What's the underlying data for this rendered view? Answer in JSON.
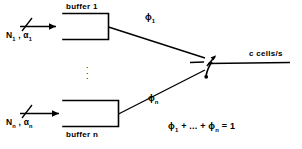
{
  "figure": {
    "type": "queueing-scheduler-diagram"
  },
  "buffers": [
    {
      "id": "buffer-1",
      "title": "buffer  1",
      "input_label_main": "N",
      "input_label_sub1": "1",
      "input_label_sep": " ,  ",
      "input_label_alpha": "α",
      "input_label_sub2": "1",
      "weight_symbol": "ϕ",
      "weight_sub": "1"
    },
    {
      "id": "buffer-n",
      "title": "buffer  n",
      "input_label_main": "N",
      "input_label_sub1": "n",
      "input_label_sep": " ,  ",
      "input_label_alpha": "α",
      "input_label_sub2": "n",
      "weight_symbol": "ϕ",
      "weight_sub": "n"
    }
  ],
  "vertical_ellipsis": "⋮",
  "output": {
    "rate_label": "c  cells/s",
    "switch_name": "selector-switch"
  },
  "constraint": {
    "term_first_symbol": "ϕ",
    "term_first_sub": "1",
    "plus": " + ",
    "ellipsis": "...",
    "plus2": " + ",
    "term_last_symbol": "ϕ",
    "term_last_sub": "n",
    "equals": " = 1"
  },
  "colors": {
    "ink": "#000000",
    "paper": "#ffffff"
  }
}
